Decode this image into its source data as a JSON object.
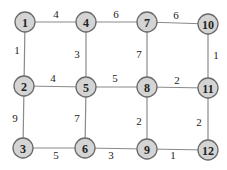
{
  "diagram": {
    "type": "weighted-grid-graph",
    "nodes": [
      {
        "id": "1",
        "x": 25,
        "y": 22
      },
      {
        "id": "4",
        "x": 86,
        "y": 22
      },
      {
        "id": "7",
        "x": 147,
        "y": 22
      },
      {
        "id": "10",
        "x": 208,
        "y": 24
      },
      {
        "id": "2",
        "x": 24,
        "y": 86
      },
      {
        "id": "5",
        "x": 86,
        "y": 87
      },
      {
        "id": "8",
        "x": 147,
        "y": 87
      },
      {
        "id": "11",
        "x": 208,
        "y": 88
      },
      {
        "id": "3",
        "x": 23,
        "y": 148
      },
      {
        "id": "6",
        "x": 85,
        "y": 148
      },
      {
        "id": "9",
        "x": 147,
        "y": 149
      },
      {
        "id": "12",
        "x": 208,
        "y": 150
      }
    ],
    "edges": [
      {
        "from": "1",
        "to": "4",
        "weight": "4",
        "lx": 56,
        "ly": 14
      },
      {
        "from": "4",
        "to": "7",
        "weight": "6",
        "lx": 116,
        "ly": 14
      },
      {
        "from": "7",
        "to": "10",
        "weight": "6",
        "lx": 176,
        "ly": 15
      },
      {
        "from": "1",
        "to": "2",
        "weight": "1",
        "lx": 17,
        "ly": 50
      },
      {
        "from": "4",
        "to": "5",
        "weight": "3",
        "lx": 77,
        "ly": 54
      },
      {
        "from": "7",
        "to": "8",
        "weight": "7",
        "lx": 139,
        "ly": 54
      },
      {
        "from": "10",
        "to": "11",
        "weight": "1",
        "lx": 216,
        "ly": 55
      },
      {
        "from": "2",
        "to": "5",
        "weight": "4",
        "lx": 53,
        "ly": 78
      },
      {
        "from": "5",
        "to": "8",
        "weight": "5",
        "lx": 115,
        "ly": 78
      },
      {
        "from": "8",
        "to": "11",
        "weight": "2",
        "lx": 177,
        "ly": 80
      },
      {
        "from": "2",
        "to": "3",
        "weight": "9",
        "lx": 15,
        "ly": 118
      },
      {
        "from": "5",
        "to": "6",
        "weight": "7",
        "lx": 77,
        "ly": 118
      },
      {
        "from": "8",
        "to": "9",
        "weight": "2",
        "lx": 139,
        "ly": 121
      },
      {
        "from": "11",
        "to": "12",
        "weight": "2",
        "lx": 199,
        "ly": 122
      },
      {
        "from": "3",
        "to": "6",
        "weight": "5",
        "lx": 56,
        "ly": 155
      },
      {
        "from": "6",
        "to": "9",
        "weight": "3",
        "lx": 111,
        "ly": 155
      },
      {
        "from": "9",
        "to": "12",
        "weight": "1",
        "lx": 173,
        "ly": 155
      }
    ],
    "colors": {
      "node_fill": "#d4d4d4",
      "node_stroke": "#6a6a6a",
      "edge": "#8a8a8a",
      "text": "#222222"
    }
  }
}
